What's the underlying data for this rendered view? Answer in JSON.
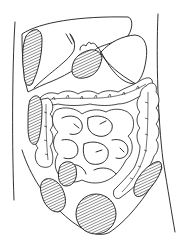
{
  "figure": {
    "type": "anatomical-line-drawing",
    "text_labels": [],
    "colors": {
      "line": "#1a1a1a",
      "background": "#ffffff"
    },
    "structures": [
      {
        "id": "liver",
        "style": "outline"
      },
      {
        "id": "gallbladder",
        "style": "hatched"
      },
      {
        "id": "stomach",
        "style": "outline"
      },
      {
        "id": "transverse-colon",
        "style": "outline"
      },
      {
        "id": "ascending-colon",
        "style": "outline"
      },
      {
        "id": "descending-colon",
        "style": "outline"
      },
      {
        "id": "small-intestine",
        "style": "outline"
      },
      {
        "id": "right-upper-flank-region",
        "style": "hatched"
      },
      {
        "id": "right-lower-flank-region",
        "style": "hatched"
      },
      {
        "id": "right-iliac-region-upper",
        "style": "hatched"
      },
      {
        "id": "right-iliac-region-lower",
        "style": "hatched"
      },
      {
        "id": "left-iliac-region",
        "style": "hatched"
      },
      {
        "id": "suprapubic-region",
        "style": "hatched"
      }
    ],
    "hatched_region_count": 7
  }
}
